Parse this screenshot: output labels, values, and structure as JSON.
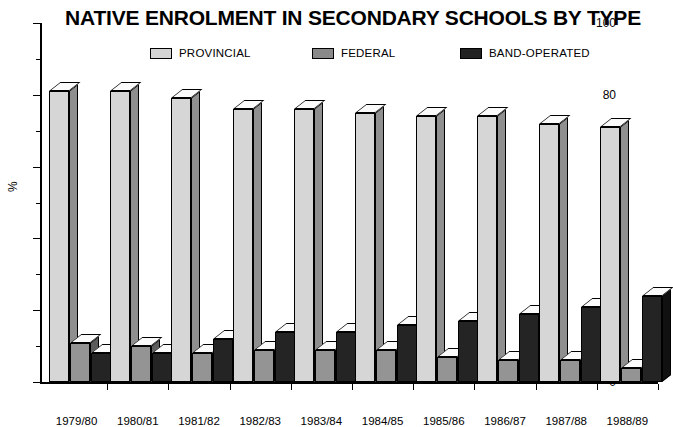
{
  "chart_data": {
    "type": "bar",
    "title": "NATIVE ENROLMENT IN SECONDARY SCHOOLS BY TYPE",
    "xlabel": "",
    "ylabel": "%",
    "ylim": [
      0,
      100
    ],
    "ytick_labels": [
      "0",
      "20",
      "40",
      "60",
      "80",
      "100"
    ],
    "ytick_values": [
      0,
      20,
      40,
      60,
      80,
      100
    ],
    "minor_ytick_values": [
      10,
      30,
      50,
      70,
      90
    ],
    "grid": false,
    "legend_position": "top-center",
    "categories": [
      "1979/80",
      "1980/81",
      "1981/82",
      "1982/83",
      "1983/84",
      "1984/85",
      "1985/86",
      "1986/87",
      "1987/88",
      "1988/89"
    ],
    "series": [
      {
        "name": "PROVINCIAL",
        "color": "#d6d6d6",
        "values": [
          81,
          81,
          79,
          76,
          76,
          75,
          74,
          74,
          72,
          71
        ]
      },
      {
        "name": "FEDERAL",
        "color": "#949494",
        "values": [
          11,
          10,
          8,
          9,
          9,
          9,
          7,
          6,
          6,
          4
        ]
      },
      {
        "name": "BAND-OPERATED",
        "color": "#242424",
        "values": [
          8,
          8,
          12,
          14,
          14,
          16,
          17,
          19,
          21,
          24
        ]
      }
    ]
  },
  "legend": {
    "items": [
      {
        "label": "PROVINCIAL",
        "swatch": "sw-prov"
      },
      {
        "label": "FEDERAL",
        "swatch": "sw-fed"
      },
      {
        "label": "BAND-OPERATED",
        "swatch": "sw-band"
      }
    ]
  }
}
